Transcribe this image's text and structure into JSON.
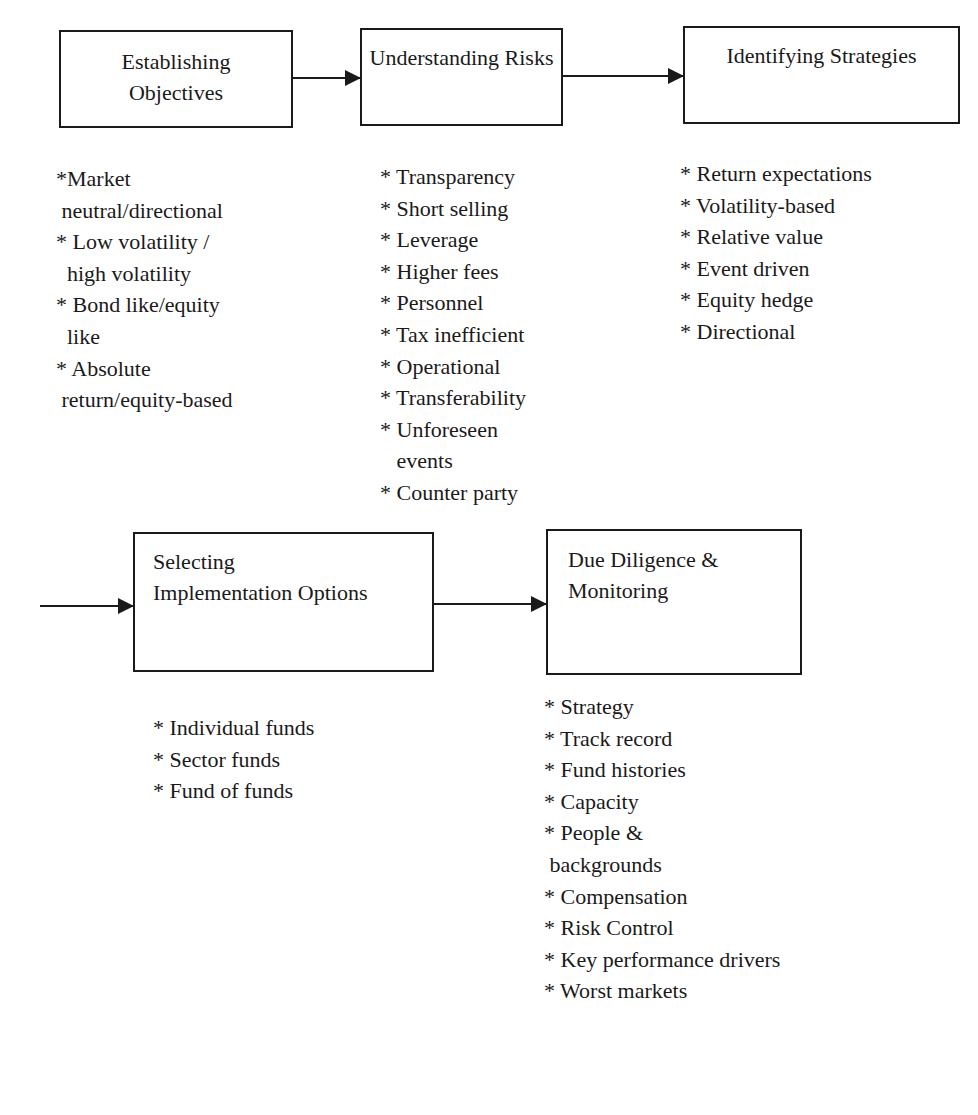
{
  "diagram": {
    "boxes": [
      {
        "id": "establishing-objectives",
        "title_lines": [
          "Establishing",
          "Objectives"
        ]
      },
      {
        "id": "understanding-risks",
        "title_lines": [
          "Understanding Risks"
        ]
      },
      {
        "id": "identifying-strategies",
        "title_lines": [
          "Identifying Strategies"
        ]
      },
      {
        "id": "selecting-implementation-options",
        "title_lines": [
          "Selecting",
          "Implementation Options"
        ]
      },
      {
        "id": "due-diligence-monitoring",
        "title_lines": [
          "Due Diligence &",
          "Monitoring"
        ]
      }
    ],
    "lists": {
      "objectives": [
        "*Market",
        " neutral/directional",
        "* Low volatility /",
        "  high volatility",
        "* Bond like/equity",
        "  like",
        "* Absolute",
        " return/equity-based"
      ],
      "risks": [
        "* Transparency",
        "* Short selling",
        "* Leverage",
        "* Higher fees",
        "* Personnel",
        "* Tax inefficient",
        "* Operational",
        "* Transferability",
        "* Unforeseen",
        "   events",
        "* Counter party"
      ],
      "strategies": [
        "* Return expectations",
        "* Volatility-based",
        "* Relative value",
        "* Event driven",
        "* Equity hedge",
        "* Directional"
      ],
      "implementation": [
        "* Individual funds",
        "* Sector funds",
        "* Fund of funds"
      ],
      "due_diligence": [
        "* Strategy",
        "* Track record",
        "* Fund histories",
        "* Capacity",
        "* People &",
        " backgrounds",
        "* Compensation",
        "* Risk Control",
        "* Key performance drivers",
        "* Worst markets"
      ]
    },
    "arrows": [
      {
        "from": "establishing-objectives",
        "to": "understanding-risks"
      },
      {
        "from": "understanding-risks",
        "to": "identifying-strategies"
      },
      {
        "from": "identifying-strategies",
        "to": "selecting-implementation-options"
      },
      {
        "from": "selecting-implementation-options",
        "to": "due-diligence-monitoring"
      }
    ],
    "colors": {
      "line": "#1a1a1a",
      "background": "#ffffff"
    }
  }
}
